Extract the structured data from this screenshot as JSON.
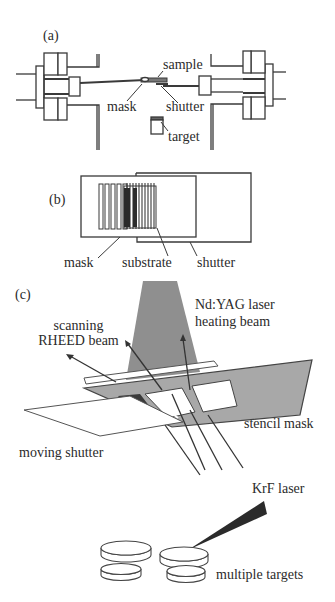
{
  "figure": {
    "panel_a": {
      "label": "(a)",
      "annotations": {
        "sample": "sample",
        "mask": "mask",
        "shutter": "shutter",
        "target": "target"
      }
    },
    "panel_b": {
      "label": "(b)",
      "annotations": {
        "mask": "mask",
        "substrate": "substrate",
        "shutter": "shutter"
      }
    },
    "panel_c": {
      "label": "(c)",
      "annotations": {
        "ndyag_line1": "Nd:YAG laser",
        "ndyag_line2": "heating beam",
        "rheed_line1": "scanning",
        "rheed_line2": "RHEED beam",
        "stencil_mask": "stencil mask",
        "moving_shutter": "moving shutter",
        "krf_laser": "KrF laser",
        "multiple_targets": "multiple targets"
      }
    },
    "colors": {
      "line": "#3a3a3a",
      "beam_fill": "#8f8f8f",
      "mask_fill": "#a8a8a8",
      "dark_stripe": "#2b2b2b",
      "background": "#ffffff"
    }
  }
}
